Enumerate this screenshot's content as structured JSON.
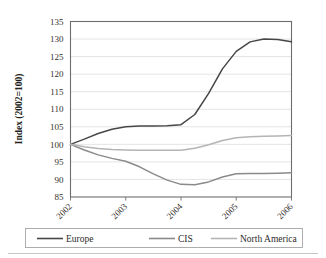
{
  "chart_data": {
    "type": "line",
    "title": "",
    "xlabel": "",
    "ylabel": "Index (2002=100)",
    "ylim": [
      85,
      135
    ],
    "ytick_step": 5,
    "yticks": [
      "85",
      "90",
      "95",
      "100",
      "105",
      "110",
      "115",
      "120",
      "125",
      "130",
      "135"
    ],
    "categories": [
      "2002",
      "2003",
      "2004",
      "2005",
      "2006"
    ],
    "x": [
      2002,
      2003,
      2004,
      2005,
      2006
    ],
    "grid": "horizontal",
    "legend_position": "bottom",
    "xlabel_rotation": 45,
    "series": [
      {
        "name": "Europe",
        "color": "#474747",
        "values": [
          100,
          105,
          105.6,
          129.9,
          129.2
        ],
        "dense_x": [
          2002,
          2002.25,
          2002.5,
          2002.75,
          2003,
          2003.25,
          2003.5,
          2003.75,
          2004,
          2004.25,
          2004.5,
          2004.75,
          2005,
          2005.25,
          2005.5,
          2005.75,
          2006
        ],
        "dense_y": [
          100,
          101.5,
          103.1,
          104.3,
          105,
          105.2,
          105.2,
          105.3,
          105.6,
          108.5,
          114.5,
          121.5,
          126.5,
          129.2,
          130,
          129.9,
          129.2
        ]
      },
      {
        "name": "CIS",
        "color": "#8a8a8a",
        "values": [
          100,
          95.2,
          88.6,
          91.6,
          91.9
        ],
        "dense_x": [
          2002,
          2002.25,
          2002.5,
          2002.75,
          2003,
          2003.25,
          2003.5,
          2003.75,
          2004,
          2004.25,
          2004.5,
          2004.75,
          2005,
          2005.25,
          2005.5,
          2005.75,
          2006
        ],
        "dense_y": [
          100,
          98.4,
          97.0,
          96.0,
          95.2,
          93.6,
          91.6,
          89.8,
          88.6,
          88.5,
          89.3,
          90.7,
          91.6,
          91.7,
          91.7,
          91.8,
          91.9
        ]
      },
      {
        "name": "North America",
        "color": "#b4b4b4",
        "values": [
          100,
          98.4,
          98.3,
          101.9,
          102.5
        ],
        "dense_x": [
          2002,
          2002.25,
          2002.5,
          2002.75,
          2003,
          2003.25,
          2003.5,
          2003.75,
          2004,
          2004.25,
          2004.5,
          2004.75,
          2005,
          2005.25,
          2005.5,
          2005.75,
          2006
        ],
        "dense_y": [
          100,
          99.3,
          98.8,
          98.5,
          98.4,
          98.3,
          98.3,
          98.3,
          98.3,
          98.9,
          99.9,
          101.1,
          101.9,
          102.2,
          102.3,
          102.4,
          102.5
        ]
      }
    ]
  },
  "legend": {
    "items": [
      {
        "label": "Europe"
      },
      {
        "label": "CIS"
      },
      {
        "label": "North America"
      }
    ]
  },
  "colors": {
    "europe": "#474747",
    "cis": "#8a8a8a",
    "north_america": "#b4b4b4",
    "grid": "#d8d8d8",
    "axis": "#6e6e6e",
    "text": "#2b2b2b",
    "background": "#ffffff"
  }
}
